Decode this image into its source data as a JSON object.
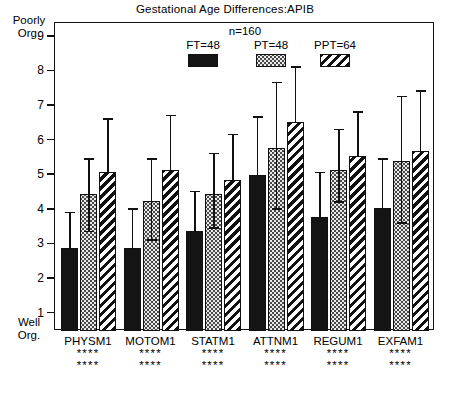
{
  "chart_data": {
    "type": "bar",
    "title": "Gestational Age Differences:APIB",
    "xlabel": "",
    "ylabel": "",
    "ylim": [
      0.5,
      9.4
    ],
    "yticks": [
      1,
      2,
      3,
      4,
      5,
      6,
      7,
      8,
      9
    ],
    "grid": false,
    "legend_position": "top-center",
    "axis_top_caption": "Poorly\nOrg.",
    "axis_bottom_caption": "Well\nOrg.",
    "sample_note": "n=160",
    "categories": [
      "PHYSM1",
      "MOTOM1",
      "STATM1",
      "ATTNM1",
      "REGUM1",
      "EXFAM1"
    ],
    "significance": [
      "****",
      "****",
      "****",
      "****",
      "****",
      "****"
    ],
    "significance_row2": [
      "****",
      "****",
      "****",
      "****",
      "****",
      "****"
    ],
    "series": [
      {
        "name": "FT=48",
        "pattern": "solid-black",
        "values": [
          2.9,
          2.9,
          3.4,
          5.0,
          3.8,
          4.05
        ],
        "err_low": [
          2.9,
          2.9,
          3.4,
          5.0,
          3.8,
          4.05
        ],
        "err_high": [
          3.95,
          4.05,
          4.55,
          6.7,
          5.1,
          5.5
        ]
      },
      {
        "name": "PT=48",
        "pattern": "dotted-stipple",
        "values": [
          4.45,
          4.25,
          4.45,
          5.8,
          5.15,
          5.4
        ],
        "err_low": [
          3.35,
          3.1,
          3.45,
          4.0,
          4.2,
          3.6
        ],
        "err_high": [
          5.5,
          5.5,
          5.65,
          7.7,
          6.35,
          7.3
        ]
      },
      {
        "name": "PPT=64",
        "pattern": "diagonal-hatch",
        "values": [
          5.1,
          5.15,
          4.85,
          6.55,
          5.55,
          5.7
        ],
        "err_low": [
          5.1,
          5.15,
          4.85,
          6.55,
          5.55,
          5.7
        ],
        "err_high": [
          6.65,
          6.75,
          6.2,
          8.15,
          6.85,
          7.45
        ]
      }
    ]
  },
  "legend": {
    "n_label": "n=160",
    "items": [
      {
        "label": "FT=48",
        "swatch": "solid-black-swatch"
      },
      {
        "label": "PT=48",
        "swatch": "dotted-swatch"
      },
      {
        "label": "PPT=64",
        "swatch": "hatched-swatch"
      }
    ]
  },
  "axis": {
    "top_caption_line1": "Poorly",
    "top_caption_line2": "Org.",
    "bottom_caption_line1": "Well",
    "bottom_caption_line2": "Org.",
    "tick_labels": [
      "9",
      "8",
      "7",
      "6",
      "5",
      "4",
      "3",
      "2",
      "1"
    ]
  },
  "colors": {
    "ink": "#111111",
    "ft_fill": "#141414",
    "pt_fill": "#e9e9e9",
    "background": "#ffffff"
  }
}
